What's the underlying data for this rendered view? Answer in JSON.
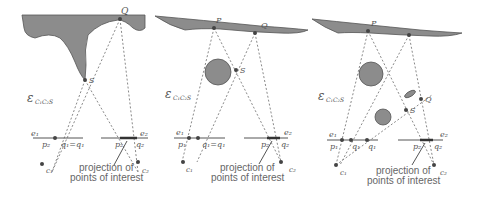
{
  "figure": {
    "panels": [
      {
        "id": "panel-1",
        "labels": {
          "Q": "Q",
          "S": "S",
          "epsilon": "ε",
          "epsilon_sub": "C₁C₂S",
          "e1": "e₁",
          "e2": "e₂",
          "p1": "p₁",
          "p2": "p₂",
          "q1eq": "q₁=q₁",
          "q2": "q₂",
          "c1": "c₁",
          "c2": "c₂"
        },
        "caption_line1": "projection of",
        "caption_line2": "points of interest"
      },
      {
        "id": "panel-2",
        "labels": {
          "P": "P",
          "Q": "Q",
          "S": "S",
          "epsilon": "ε",
          "epsilon_sub": "C₁C₂S",
          "e1": "e₁",
          "e2": "e₂",
          "p1": "p₁",
          "p2": "p₂",
          "q1eq": "q₁=q₁",
          "q2": "q₂",
          "c1": "c₁",
          "c2": "c₂"
        },
        "caption_line1": "projection of",
        "caption_line2": "points of interest"
      },
      {
        "id": "panel-3",
        "labels": {
          "P": "P",
          "Q": "Q",
          "S": "S",
          "epsilon": "ε",
          "epsilon_sub": "C₁C₂S",
          "e1": "e₁",
          "e2": "e₂",
          "p1": "p₁",
          "p2": "p₂",
          "q1": "q₁",
          "q1b": "q₁",
          "q2": "q₂",
          "c1": "c₁",
          "c2": "c₂"
        },
        "caption_line1": "projection of",
        "caption_line2": "points of interest"
      }
    ],
    "colors": {
      "shape_fill": "#8c8c8c",
      "line": "#555555",
      "dashed": "#8a8a8a"
    }
  }
}
